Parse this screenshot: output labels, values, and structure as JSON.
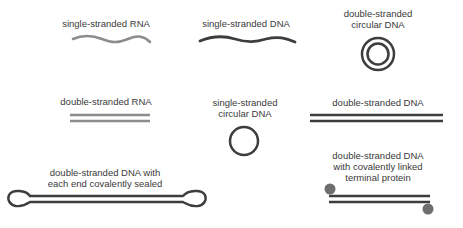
{
  "colors": {
    "rna": "#8c8c8c",
    "dna": "#3d3d3d",
    "protein": "#6e6e6e",
    "text": "#3a3a3a"
  },
  "items": [
    {
      "id": "ss-rna",
      "label": "single-stranded RNA"
    },
    {
      "id": "ss-dna",
      "label": "single-stranded DNA"
    },
    {
      "id": "ds-circ-dna",
      "label_line1": "double-stranded",
      "label_line2": "circular DNA"
    },
    {
      "id": "ds-rna",
      "label": "double-stranded RNA"
    },
    {
      "id": "ss-circ-dna",
      "label_line1": "single-stranded",
      "label_line2": "circular DNA"
    },
    {
      "id": "ds-dna",
      "label": "double-stranded DNA"
    },
    {
      "id": "ds-dna-sealed",
      "label_line1": "double-stranded DNA with",
      "label_line2": "each end covalently sealed"
    },
    {
      "id": "ds-dna-protein",
      "label_line1": "double-stranded DNA",
      "label_line2": "with covalently linked",
      "label_line3": "terminal protein"
    }
  ]
}
